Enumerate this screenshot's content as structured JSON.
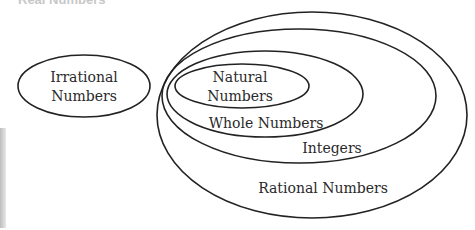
{
  "diagram": {
    "title": "Real Numbers",
    "stroke_color": "#222222",
    "sets": [
      {
        "id": "irrational",
        "label_lines": [
          "Irrational",
          "Numbers"
        ],
        "cx": 84,
        "cy": 86,
        "rx": 66,
        "ry": 31
      },
      {
        "id": "rational",
        "label_lines": [
          "Rational Numbers"
        ],
        "cx": 312,
        "cy": 115,
        "rx": 155,
        "ry": 103
      },
      {
        "id": "integers",
        "label_lines": [
          "Integers"
        ],
        "cx": 299,
        "cy": 96,
        "rx": 137,
        "ry": 67
      },
      {
        "id": "whole",
        "label_lines": [
          "Whole Numbers"
        ],
        "cx": 265,
        "cy": 94,
        "rx": 98,
        "ry": 43
      },
      {
        "id": "natural",
        "label_lines": [
          "Natural",
          "Numbers"
        ],
        "cx": 242,
        "cy": 86,
        "rx": 67,
        "ry": 22
      }
    ]
  }
}
